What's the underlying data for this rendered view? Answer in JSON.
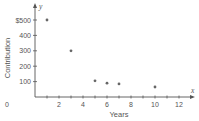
{
  "chart_data": {
    "type": "scatter",
    "title": "",
    "xlabel": "Years",
    "ylabel": "Contribution",
    "x_axis_var": "x",
    "y_axis_var": "y",
    "origin_label": "0",
    "x_ticks": [
      1,
      2,
      3,
      4,
      5,
      6,
      7,
      8,
      9,
      10,
      11,
      12
    ],
    "x_tick_labels": [
      "2",
      "4",
      "6",
      "8",
      "10",
      "12"
    ],
    "x_tick_label_values": [
      2,
      4,
      6,
      8,
      10,
      12
    ],
    "y_ticks": [
      100,
      200,
      300,
      400,
      500
    ],
    "y_tick_labels": [
      "100",
      "200",
      "300",
      "400",
      "$500"
    ],
    "xlim": [
      0,
      13.5
    ],
    "ylim": [
      0,
      550
    ],
    "grid": false,
    "legend": null,
    "points": [
      {
        "x": 1,
        "y": 500
      },
      {
        "x": 3,
        "y": 300
      },
      {
        "x": 5,
        "y": 105
      },
      {
        "x": 6,
        "y": 90
      },
      {
        "x": 7,
        "y": 85
      },
      {
        "x": 10,
        "y": 65
      }
    ],
    "colors": {
      "axis": "#555555",
      "point": "#666666",
      "text": "#555555"
    }
  }
}
